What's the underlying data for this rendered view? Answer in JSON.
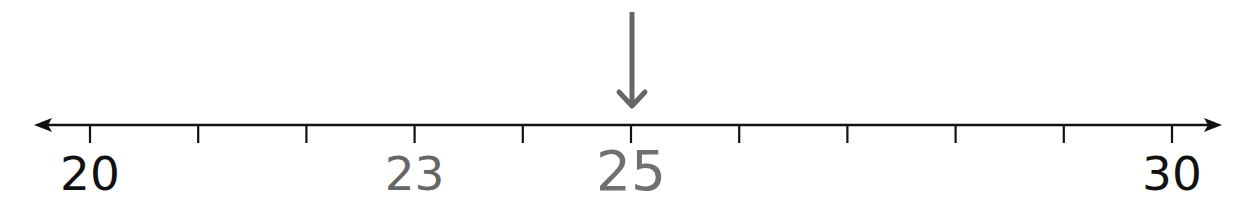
{
  "number_line": {
    "min": 20,
    "max": 30,
    "step": 1,
    "tick_values": [
      20,
      21,
      22,
      23,
      24,
      25,
      26,
      27,
      28,
      29,
      30
    ],
    "labels": [
      {
        "value": 20,
        "text": "20",
        "color": "#111111",
        "size": 47,
        "top": 150
      },
      {
        "value": 23,
        "text": "23",
        "color": "#666666",
        "size": 47,
        "top": 150
      },
      {
        "value": 25,
        "text": "25",
        "color": "#707070",
        "size": 55,
        "top": 144
      },
      {
        "value": 30,
        "text": "30",
        "color": "#111111",
        "size": 47,
        "top": 150
      }
    ],
    "pointer": {
      "value": 25,
      "icon": "down-arrow-icon",
      "color": "#666666"
    },
    "line_color": "#111111",
    "arrows": [
      "left-arrow-icon",
      "right-arrow-icon"
    ]
  },
  "chart_data": {
    "type": "number_line",
    "range": [
      20,
      30
    ],
    "tick_interval": 1,
    "tick_labels": [
      "20",
      "23",
      "25",
      "30"
    ],
    "highlighted_value": 25,
    "annotations": [
      "Downward arrow pointing at 25"
    ],
    "bidirectional_arrows": true
  }
}
